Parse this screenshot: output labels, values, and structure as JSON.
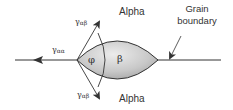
{
  "diagram": {
    "labels": {
      "alpha_top": "Alpha",
      "alpha_bottom": "Alpha",
      "grain_boundary_line1": "Grain",
      "grain_boundary_line2": "boundary",
      "gamma_aa": "γ",
      "gamma_aa_sub": "αα",
      "gamma_ab_top": "γ",
      "gamma_ab_top_sub": "αβ",
      "gamma_ab_bottom": "γ",
      "gamma_ab_bottom_sub": "αβ",
      "phi": "φ",
      "beta": "β"
    },
    "colors": {
      "line": "#333333",
      "lens_fill_light": "#e6e6e6",
      "lens_fill_dark": "#a8a8a8",
      "text": "#333333"
    }
  }
}
